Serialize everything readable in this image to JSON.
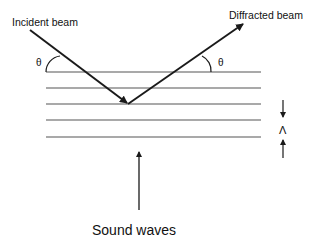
{
  "diagram": {
    "labels": {
      "incident": "Incident beam",
      "diffracted": "Diffracted beam",
      "theta_left": "θ",
      "theta_right": "θ",
      "lambda": "Λ",
      "sound": "Sound waves"
    },
    "colors": {
      "line": "#1a1a1a",
      "background": "#ffffff"
    },
    "layers": {
      "count": 5,
      "y_positions": [
        72,
        88,
        104,
        120,
        137
      ],
      "x_start": 46,
      "x_end": 261
    }
  }
}
